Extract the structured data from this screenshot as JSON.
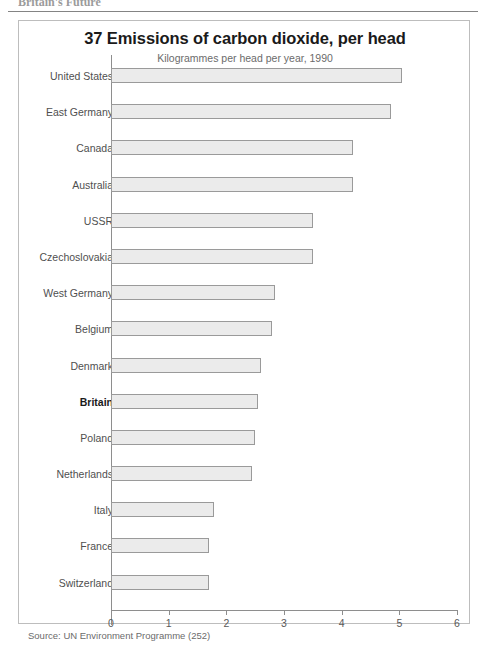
{
  "running_header": "Britain's Future",
  "figure": {
    "title": "37 Emissions of carbon dioxide, per head",
    "subtitle": "Kilogrammes per head per year, 1990",
    "source": "Source: UN Environment Programme (252)"
  },
  "axis": {
    "ticks": [
      "0",
      "1",
      "2",
      "3",
      "4",
      "5",
      "6"
    ]
  },
  "chart_data": {
    "type": "bar",
    "orientation": "horizontal",
    "title": "37 Emissions of carbon dioxide, per head",
    "subtitle": "Kilogrammes per head per year, 1990",
    "xlabel": "Kilogrammes per head per year, 1990",
    "ylabel": "",
    "xlim": [
      0,
      6
    ],
    "xticks": [
      0,
      1,
      2,
      3,
      4,
      5,
      6
    ],
    "grid": false,
    "legend": false,
    "highlight_category": "Britain",
    "source": "Source: UN Environment Programme (252)",
    "categories": [
      "United States",
      "East Germany",
      "Canada",
      "Australia",
      "USSR",
      "Czechoslovakia",
      "West Germany",
      "Belgium",
      "Denmark",
      "Britain",
      "Poland",
      "Netherlands",
      "Italy",
      "France",
      "Switzerland"
    ],
    "values": [
      5.05,
      4.85,
      4.2,
      4.2,
      3.5,
      3.5,
      2.85,
      2.8,
      2.6,
      2.55,
      2.5,
      2.45,
      1.78,
      1.7,
      1.7
    ]
  }
}
